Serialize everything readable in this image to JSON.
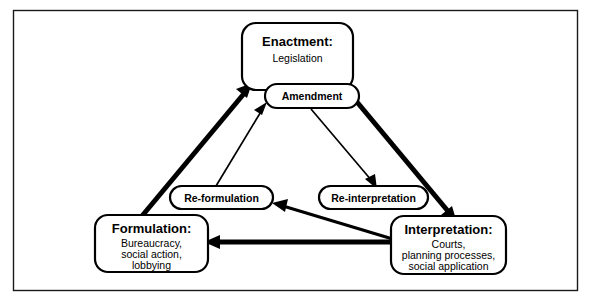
{
  "diagram": {
    "type": "cycle-diagram",
    "frame": {
      "visible": true,
      "color": "#1a1a1a"
    },
    "nodes": [
      {
        "id": "enactment",
        "shape": "rounded-box",
        "title": "Enactment:",
        "subtitle": "Legislation",
        "subtitle_lines": [
          "Legislation"
        ]
      },
      {
        "id": "formulation",
        "shape": "rounded-box",
        "title": "Formulation:",
        "subtitle": "Bureaucracy, social action, lobbying",
        "subtitle_lines": [
          "Bureaucracy,",
          "social action,",
          "lobbying"
        ]
      },
      {
        "id": "interpretation",
        "shape": "rounded-box",
        "title": "Interpretation:",
        "subtitle": "Courts, planning processes, social application",
        "subtitle_lines": [
          "Courts,",
          "planning processes,",
          "social application"
        ]
      },
      {
        "id": "amendment",
        "shape": "pill",
        "title": "Amendment"
      },
      {
        "id": "reformulation",
        "shape": "pill",
        "title": "Re-formulation"
      },
      {
        "id": "reinterpretation",
        "shape": "pill",
        "title": "Re-interpretation"
      }
    ],
    "edges": [
      {
        "id": "formulation-to-enactment",
        "from": "formulation",
        "to": "enactment",
        "weight": "thick"
      },
      {
        "id": "enactment-to-interpretation",
        "from": "enactment",
        "to": "interpretation",
        "weight": "thick"
      },
      {
        "id": "interpretation-to-formulation",
        "from": "interpretation",
        "to": "formulation",
        "weight": "thick"
      },
      {
        "id": "reformulation-to-amendment",
        "from": "reformulation",
        "to": "amendment",
        "weight": "thin"
      },
      {
        "id": "amendment-to-reinterpretation",
        "from": "amendment",
        "to": "reinterpretation",
        "weight": "thin"
      },
      {
        "id": "interpretation-to-reformulation",
        "from": "interpretation",
        "to": "reformulation",
        "weight": "medium"
      }
    ],
    "colors": {
      "stroke": "#000000",
      "fill": "#ffffff",
      "frame": "#1a1a1a"
    }
  }
}
